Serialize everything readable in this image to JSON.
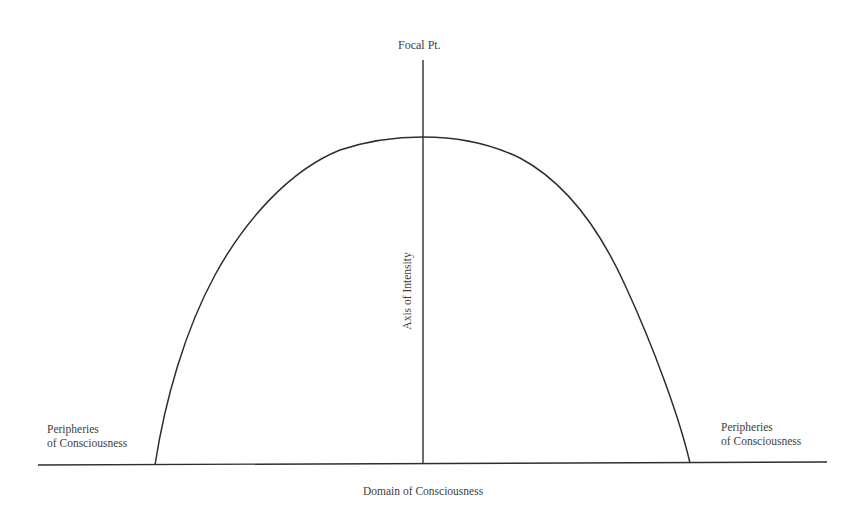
{
  "diagram": {
    "labels": {
      "focal_point": "Focal Pt.",
      "vertical_axis": "Axis of Intensity",
      "horizontal_axis": "Domain of Consciousness",
      "periphery_left": {
        "line1": "Peripheries",
        "line2": "of Consciousness"
      },
      "periphery_right": {
        "line1": "Peripheries",
        "line2": "of Consciousness"
      }
    },
    "colors": {
      "stroke": "#2e2e2e",
      "text": "#404040",
      "background": "#ffffff"
    },
    "geometry": {
      "baseline": {
        "x1": 38,
        "y1": 465,
        "x2": 827,
        "y2": 462
      },
      "vertical_axis": {
        "x": 423,
        "y_top": 60,
        "y_bottom": 464
      },
      "curve": {
        "shape": "inverted parabola",
        "left_foot": [
          155,
          465
        ],
        "peak": [
          423,
          137
        ],
        "right_foot": [
          690,
          463
        ]
      }
    }
  }
}
